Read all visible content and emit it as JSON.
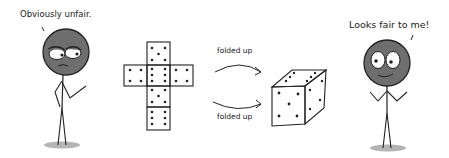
{
  "comic": {
    "left_character": {
      "speech": "Obviously unfair.",
      "expression": "suspicious",
      "head_color": "#6e6e6e"
    },
    "right_character": {
      "speech": "Looks fair to me!",
      "expression": "happy",
      "head_color": "#6e6e6e"
    },
    "dice_net": {
      "description": "Unfolded cube net",
      "faces": [
        {
          "position": "top",
          "pips": 5
        },
        {
          "position": "middle-left",
          "pips": 4
        },
        {
          "position": "middle-center",
          "pips": 6
        },
        {
          "position": "middle-right",
          "pips": 4
        },
        {
          "position": "below-center",
          "pips": 5
        },
        {
          "position": "bottom",
          "pips": 6
        }
      ]
    },
    "arrows": {
      "top_label": "folded up",
      "bottom_label": "folded up"
    },
    "folded_die": {
      "visible_faces": [
        {
          "face": "front",
          "pips": 5
        },
        {
          "face": "top",
          "pips": 6
        },
        {
          "face": "right",
          "pips": 4
        }
      ]
    },
    "colors": {
      "ink": "#222222",
      "shadow": "#b5b5b5",
      "background": "#ffffff"
    }
  }
}
